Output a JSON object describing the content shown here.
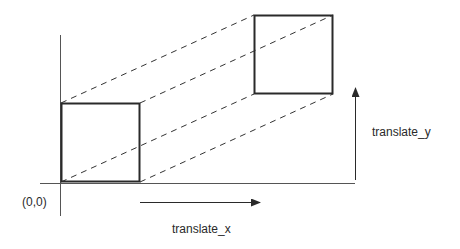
{
  "diagram": {
    "origin_label": "(0,0)",
    "translate_x_label": "translate_x",
    "translate_y_label": "translate_y",
    "colors": {
      "stroke": "#2a2a2a",
      "axis": "#555555",
      "background": "#ffffff"
    },
    "original_square": {
      "x": 61,
      "y": 103,
      "size": 79
    },
    "translated_square": {
      "x": 254,
      "y": 15,
      "size": 79
    },
    "dashed_connectors": 4
  }
}
